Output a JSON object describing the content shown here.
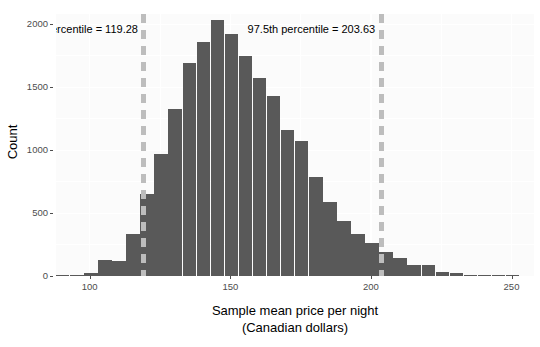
{
  "chart_data": {
    "type": "bar",
    "title": "",
    "subtitle": "",
    "xlabel": "Sample mean price per night",
    "xlabel_line2": "(Canadian dollars)",
    "ylabel": "Count",
    "xlim": [
      88,
      258
    ],
    "ylim": [
      0,
      2080
    ],
    "xticks": [
      100,
      150,
      200,
      250
    ],
    "xtick_labels": [
      "100",
      "150",
      "200",
      "250"
    ],
    "yticks": [
      0,
      500,
      1000,
      1500,
      2000
    ],
    "ytick_labels": [
      "0",
      "500",
      "1000",
      "1500",
      "2000"
    ],
    "grid": true,
    "legend": "none",
    "bin_width": 5,
    "bar_color": "#595959",
    "vline_color": "#bdbdbd",
    "panel_color": "#fbfbfb",
    "bins": [
      {
        "x_left": 88,
        "x_center": 90.5,
        "count": 2
      },
      {
        "x_left": 93,
        "x_center": 95.5,
        "count": 5
      },
      {
        "x_left": 98,
        "x_center": 100.5,
        "count": 25
      },
      {
        "x_left": 103,
        "x_center": 105.5,
        "count": 125
      },
      {
        "x_left": 108,
        "x_center": 110.5,
        "count": 120
      },
      {
        "x_left": 113,
        "x_center": 115.5,
        "count": 330
      },
      {
        "x_left": 118,
        "x_center": 120.5,
        "count": 650
      },
      {
        "x_left": 123,
        "x_center": 125.5,
        "count": 970
      },
      {
        "x_left": 128,
        "x_center": 130.5,
        "count": 1325
      },
      {
        "x_left": 133,
        "x_center": 135.5,
        "count": 1690
      },
      {
        "x_left": 138,
        "x_center": 140.5,
        "count": 1855
      },
      {
        "x_left": 143,
        "x_center": 145.5,
        "count": 2035
      },
      {
        "x_left": 148,
        "x_center": 150.5,
        "count": 1925
      },
      {
        "x_left": 153,
        "x_center": 155.5,
        "count": 1750
      },
      {
        "x_left": 158,
        "x_center": 160.5,
        "count": 1570
      },
      {
        "x_left": 163,
        "x_center": 165.5,
        "count": 1430
      },
      {
        "x_left": 168,
        "x_center": 170.5,
        "count": 1160
      },
      {
        "x_left": 173,
        "x_center": 175.5,
        "count": 1070
      },
      {
        "x_left": 178,
        "x_center": 180.5,
        "count": 790
      },
      {
        "x_left": 183,
        "x_center": 185.5,
        "count": 590
      },
      {
        "x_left": 188,
        "x_center": 190.5,
        "count": 440
      },
      {
        "x_left": 193,
        "x_center": 195.5,
        "count": 330
      },
      {
        "x_left": 198,
        "x_center": 200.5,
        "count": 260
      },
      {
        "x_left": 203,
        "x_center": 205.5,
        "count": 190
      },
      {
        "x_left": 208,
        "x_center": 210.5,
        "count": 145
      },
      {
        "x_left": 213,
        "x_center": 215.5,
        "count": 90
      },
      {
        "x_left": 218,
        "x_center": 220.5,
        "count": 90
      },
      {
        "x_left": 223,
        "x_center": 225.5,
        "count": 30
      },
      {
        "x_left": 228,
        "x_center": 230.5,
        "count": 20
      },
      {
        "x_left": 233,
        "x_center": 235.5,
        "count": 8
      },
      {
        "x_left": 238,
        "x_center": 240.5,
        "count": 4
      },
      {
        "x_left": 243,
        "x_center": 245.5,
        "count": 2
      },
      {
        "x_left": 248,
        "x_center": 250.5,
        "count": 1
      }
    ],
    "vlines": [
      {
        "name": "lower-percentile",
        "value": 119.28,
        "label": "2.5th percentile = 119.28",
        "label_x": 122,
        "label_y": 1960,
        "label_align": "left"
      },
      {
        "name": "upper-percentile",
        "value": 203.63,
        "label": "97.5th percentile = 203.63",
        "label_x": 207,
        "label_y": 1960,
        "label_align": "left"
      }
    ]
  },
  "annotations": {
    "lower": "2.5th percentile = 119.28",
    "upper": "97.5th percentile = 203.63"
  }
}
